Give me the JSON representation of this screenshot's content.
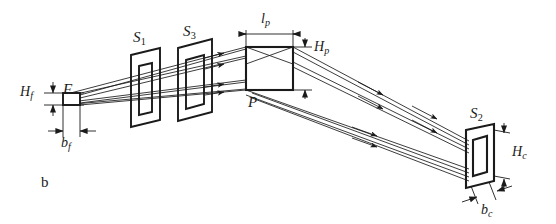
{
  "figure": {
    "caption": "b",
    "background_color": "#ffffff",
    "line_color": "#1a1a1a",
    "width": 556,
    "height": 224
  },
  "components": {
    "source": {
      "label": "F",
      "name": "source-F"
    },
    "slit1": {
      "label": "S",
      "sub": "1",
      "name": "slit-S1"
    },
    "slit3": {
      "label": "S",
      "sub": "3",
      "name": "slit-S3"
    },
    "prism": {
      "label": "P",
      "name": "prism-P"
    },
    "slit2": {
      "label": "S",
      "sub": "2",
      "name": "slit-S2"
    }
  },
  "dimensions": {
    "source_height": {
      "label": "H",
      "sub": "f",
      "name": "dimension-Hf"
    },
    "source_width": {
      "label": "b",
      "sub": "f",
      "name": "dimension-bf"
    },
    "prism_length": {
      "label": "l",
      "sub": "p",
      "name": "dimension-lp"
    },
    "prism_height": {
      "label": "H",
      "sub": "p",
      "name": "dimension-Hp"
    },
    "aperture_height": {
      "label": "H",
      "sub": "c",
      "name": "dimension-Hc"
    },
    "aperture_width": {
      "label": "b",
      "sub": "c",
      "name": "dimension-bc"
    }
  }
}
